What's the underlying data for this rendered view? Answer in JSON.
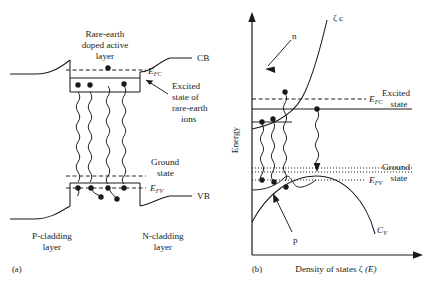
{
  "figure": {
    "panels": [
      {
        "id": "a",
        "tag": "(a)",
        "labels": {
          "active_layer": [
            "Rare-earth",
            "doped active",
            "layer"
          ],
          "cb": "CB",
          "vb": "VB",
          "efc": "E",
          "efc_sub": "FC",
          "efv": "E",
          "efv_sub": "FV",
          "excited_state": [
            "Excited",
            "state of",
            "rare-earth",
            "ions"
          ],
          "ground_state": [
            "Ground",
            "state"
          ],
          "p_cladding": [
            "P-cladding",
            "layer"
          ],
          "n_cladding": [
            "N-cladding",
            "layer"
          ]
        }
      },
      {
        "id": "b",
        "tag": "(b)",
        "labels": {
          "y_axis": "Energy",
          "x_axis_prefix": "Density of states ",
          "x_axis_zeta": "ζ",
          "x_axis_suffix": " (E)",
          "zeta_c": "ζ c",
          "c_v": "C",
          "c_v_sub": "V",
          "n": "n",
          "p": "p",
          "efc": "E",
          "efc_sub": "FC",
          "efv": "E",
          "efv_sub": "FV",
          "excited_state": [
            "Excited",
            "state"
          ],
          "ground_state": [
            "Ground",
            "state"
          ]
        }
      }
    ],
    "colors": {
      "ink": "#1a1a1a",
      "background": "#ffffff"
    }
  }
}
